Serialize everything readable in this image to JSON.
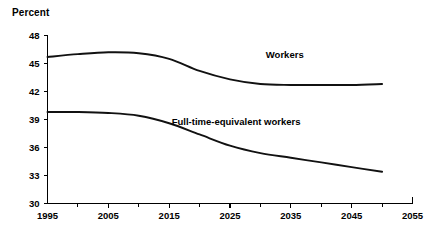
{
  "chart_data": {
    "type": "line",
    "title": "Percent",
    "xlabel": "",
    "ylabel": "Percent",
    "xlim": [
      1995,
      2055
    ],
    "ylim": [
      30,
      48
    ],
    "grid": false,
    "legend_position": "inline-annotations",
    "y_ticks": [
      48,
      45,
      42,
      39,
      36,
      33,
      30
    ],
    "x_ticks": [
      1995,
      2005,
      2015,
      2025,
      2035,
      2045,
      2055
    ],
    "x_minor_ticks": [
      2000,
      2010,
      2020,
      2030,
      2040,
      2050
    ],
    "x": [
      1995,
      2000,
      2005,
      2010,
      2015,
      2020,
      2025,
      2030,
      2035,
      2040,
      2045,
      2050
    ],
    "series": [
      {
        "name": "Workers",
        "label": "Workers",
        "color": "#111111",
        "label_x": 2034,
        "label_y": 45.6,
        "values": [
          45.7,
          46.0,
          46.2,
          46.1,
          45.5,
          44.2,
          43.3,
          42.8,
          42.7,
          42.7,
          42.7,
          42.8
        ]
      },
      {
        "name": "Full-time-equivalent workers",
        "label": "Full-time-equivalent workers",
        "color": "#111111",
        "label_x": 2026,
        "label_y": 38.4,
        "values": [
          39.8,
          39.8,
          39.7,
          39.4,
          38.6,
          37.4,
          36.2,
          35.4,
          34.9,
          34.4,
          33.9,
          33.4
        ]
      }
    ]
  },
  "axis": {
    "y_labels": [
      "48",
      "45",
      "42",
      "39",
      "36",
      "33",
      "30"
    ],
    "x_labels": [
      "1995",
      "2005",
      "2015",
      "2025",
      "2035",
      "2045",
      "2055"
    ]
  },
  "annotations": {
    "workers_label": "Workers",
    "fte_label": "Full-time-equivalent workers"
  },
  "header": {
    "unit_title": "Percent"
  }
}
